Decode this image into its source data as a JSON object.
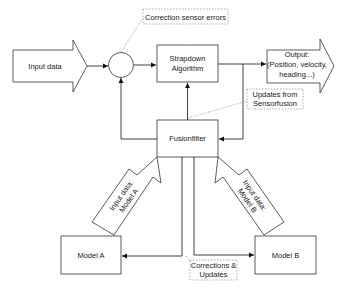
{
  "diagram": {
    "input_arrow": {
      "label": "Input data"
    },
    "summing_junction": {
      "label": ""
    },
    "strapdown": {
      "line1": "Strapdown",
      "line2": "Algorithm"
    },
    "output_arrow": {
      "line1": "Output:",
      "line2": "(Position, velocity,",
      "line3": "heading...)"
    },
    "note_correction": {
      "label": "Correction sensor errors"
    },
    "note_updates": {
      "line1": "Updates from",
      "line2": "Sensorfusion"
    },
    "fusionfilter": {
      "label": "Fusionfilter"
    },
    "input_model_a": {
      "line1": "Input data:",
      "line2": "Model A"
    },
    "input_model_b": {
      "line1": "Input data:",
      "line2": "Model B"
    },
    "model_a": {
      "label": "Model A"
    },
    "model_b": {
      "label": "Model B"
    },
    "note_corrections_updates": {
      "line1": "Corrections &",
      "line2": "Updates"
    }
  }
}
